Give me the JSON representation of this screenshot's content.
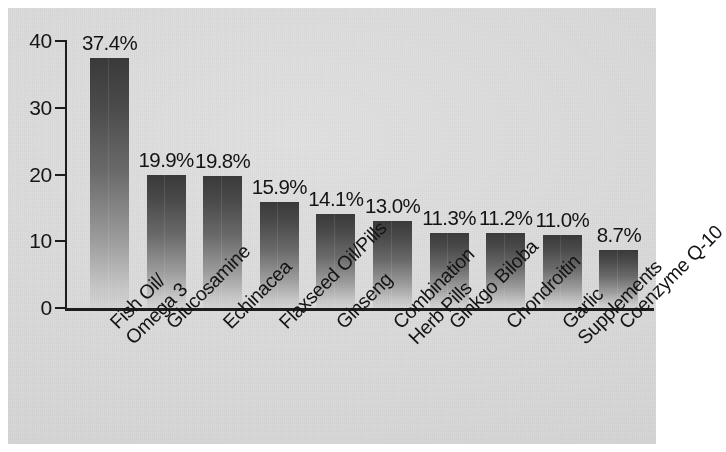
{
  "chart_data": {
    "type": "bar",
    "title": "",
    "subtitle": "",
    "xlabel": "",
    "ylabel": "",
    "ylim": [
      0,
      40
    ],
    "yticks": [
      0,
      10,
      20,
      30,
      40
    ],
    "grid": false,
    "legend": null,
    "value_label_suffix": "%",
    "categories": [
      "Fish Oil/\nOmega 3",
      "Glucosamine",
      "Echinacea",
      "Flaxseed Oil/Pills",
      "Ginseng",
      "Combination\nHerb Pills",
      "Ginkgo Biloba",
      "Chondroitin",
      "Garlic\nSupplements",
      "Coenzyme Q-10"
    ],
    "values": [
      37.4,
      19.9,
      19.8,
      15.9,
      14.1,
      13.0,
      11.3,
      11.2,
      11.0,
      8.7
    ],
    "value_labels": [
      "37.4%",
      "19.9%",
      "19.8%",
      "15.9%",
      "14.1%",
      "13.0%",
      "11.3%",
      "11.2%",
      "11.0%",
      "8.7%"
    ]
  },
  "axes": {
    "y_tick_labels": [
      "40",
      "30",
      "20",
      "10",
      "0"
    ]
  },
  "category_lines": [
    [
      "Fish Oil/",
      "Omega 3"
    ],
    [
      "Glucosamine",
      ""
    ],
    [
      "Echinacea",
      ""
    ],
    [
      "Flaxseed Oil/Pills",
      ""
    ],
    [
      "Ginseng",
      ""
    ],
    [
      "Combination",
      "Herb Pills"
    ],
    [
      "Ginkgo Biloba",
      ""
    ],
    [
      "Chondroitin",
      ""
    ],
    [
      "Garlic",
      "Supplements"
    ],
    [
      "Coenzyme Q-10",
      ""
    ]
  ],
  "style": {
    "bar_top_color": "#3b3b3b",
    "bar_bottom_color": "#d6d6d6",
    "background_color": "#dcdcdc",
    "page_color": "#ffffff",
    "axis_color": "#1d1d1d",
    "text_color": "#141414"
  }
}
